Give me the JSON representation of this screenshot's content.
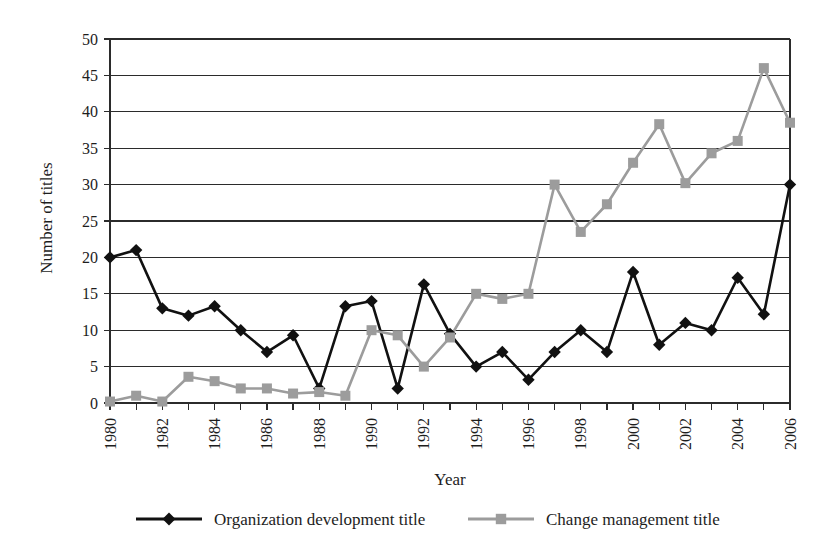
{
  "chart_data": {
    "type": "line",
    "title": "",
    "xlabel": "Year",
    "ylabel": "Number of titles",
    "xlim": [
      1980,
      2006
    ],
    "ylim": [
      0,
      50
    ],
    "ytick_step": 5,
    "yticks": [
      0,
      5,
      10,
      15,
      20,
      25,
      30,
      35,
      40,
      45,
      50
    ],
    "xticks": [
      1980,
      1981,
      1982,
      1983,
      1984,
      1985,
      1986,
      1987,
      1988,
      1989,
      1990,
      1991,
      1992,
      1993,
      1994,
      1995,
      1996,
      1997,
      1998,
      1999,
      2000,
      2001,
      2002,
      2003,
      2004,
      2005,
      2006
    ],
    "xtick_labels_shown": [
      1980,
      1982,
      1984,
      1986,
      1988,
      1990,
      1992,
      1994,
      1996,
      1998,
      2000,
      2002,
      2004,
      2006
    ],
    "xtick_label_rotation": -90,
    "grid": "horizontal",
    "legend_position": "bottom",
    "x": [
      1980,
      1981,
      1982,
      1983,
      1984,
      1985,
      1986,
      1987,
      1988,
      1989,
      1990,
      1991,
      1992,
      1993,
      1994,
      1995,
      1996,
      1997,
      1998,
      1999,
      2000,
      2001,
      2002,
      2003,
      2004,
      2005,
      2006
    ],
    "series": [
      {
        "name": "Organization development title",
        "color": "#111111",
        "marker": "diamond",
        "values": [
          20,
          21,
          13,
          12,
          13.3,
          10,
          7,
          9.3,
          2,
          13.3,
          14,
          2,
          16.3,
          9.5,
          5,
          7,
          3.2,
          7,
          10,
          7,
          18,
          8,
          11,
          10,
          17.2,
          12.2,
          30
        ]
      },
      {
        "name": "Change management title",
        "color": "#9c9c9c",
        "marker": "square",
        "values": [
          0.2,
          1,
          0.2,
          3.6,
          3,
          2,
          2,
          1.3,
          1.5,
          1,
          10,
          9.3,
          5,
          9,
          15,
          14.3,
          15,
          30,
          23.5,
          27.3,
          33,
          38.3,
          30.2,
          34.3,
          36,
          46,
          38.5
        ]
      }
    ]
  },
  "legend": {
    "items": [
      {
        "label": "Organization development title",
        "color": "#111111",
        "marker": "diamond"
      },
      {
        "label": "Change management title",
        "color": "#9c9c9c",
        "marker": "square"
      }
    ]
  }
}
